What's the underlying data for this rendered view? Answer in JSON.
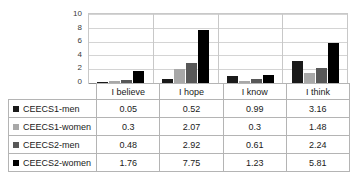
{
  "chart_data": {
    "type": "bar",
    "title": "",
    "xlabel": "",
    "ylabel": "",
    "ylim": [
      0,
      10
    ],
    "yticks": [
      10,
      8,
      6,
      4,
      2,
      0
    ],
    "grid": true,
    "legend_position": "table-below",
    "categories": [
      "I believe",
      "I hope",
      "I know",
      "I think"
    ],
    "series": [
      {
        "name": "CEECS1-men",
        "color": "#1a1a1a",
        "values": [
          0.05,
          0.52,
          0.99,
          3.16
        ]
      },
      {
        "name": "CEECS1-women",
        "color": "#a8a8a8",
        "values": [
          0.3,
          2.07,
          0.3,
          1.48
        ]
      },
      {
        "name": "CEECS2-men",
        "color": "#585858",
        "values": [
          0.48,
          2.92,
          0.61,
          2.24
        ]
      },
      {
        "name": "CEECS2-women",
        "color": "#000000",
        "values": [
          1.76,
          7.75,
          1.23,
          5.81
        ]
      }
    ]
  },
  "table": {
    "header_labels": [
      "",
      "I believe",
      "I hope",
      "I know",
      "I think"
    ],
    "rows": [
      {
        "label": "CEECS1-men",
        "swatch": "#1a1a1a",
        "cells": [
          "0.05",
          "0.52",
          "0.99",
          "3.16"
        ]
      },
      {
        "label": "CEECS1-women",
        "swatch": "#a8a8a8",
        "cells": [
          "0.3",
          "2.07",
          "0.3",
          "1.48"
        ]
      },
      {
        "label": "CEECS2-men",
        "swatch": "#585858",
        "cells": [
          "0.48",
          "2.92",
          "0.61",
          "2.24"
        ]
      },
      {
        "label": "CEECS2-women",
        "swatch": "#000000",
        "cells": [
          "1.76",
          "7.75",
          "1.23",
          "5.81"
        ]
      }
    ]
  }
}
